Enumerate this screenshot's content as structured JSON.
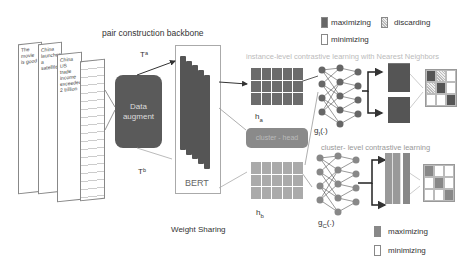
{
  "title": "pair construction backbone",
  "documents": [
    {
      "text": "The movie is good"
    },
    {
      "text": "China launches a satellite"
    },
    {
      "text": "China US trade income exceeded 2 trillion"
    },
    {
      "text": ""
    }
  ],
  "labels": {
    "ta": "Tᵃ",
    "tb": "Tᵇ",
    "data_augment": "Data augment",
    "bert": "BERT",
    "weight_sharing": "Weight Sharing",
    "ha": "h",
    "ha_sub": "a",
    "hb": "h",
    "hb_sub": "b",
    "cluster_head": "cluster - head",
    "gi": "g",
    "gi_sub": "I",
    "gi_suffix": "(.)",
    "gc": "g",
    "gc_sub": "C",
    "gc_suffix": "(.)",
    "instance_title": "instance-level contrastive learning with Nearest Neighbors",
    "cluster_title": "cluster- level contrastive learning"
  },
  "legend_top": [
    {
      "label": "maximizing",
      "style": "dark"
    },
    {
      "label": "discarding",
      "style": "hatch"
    },
    {
      "label": "minimizing",
      "style": "white"
    }
  ],
  "legend_bottom": [
    {
      "label": "maximizing",
      "style": "gray"
    },
    {
      "label": "minimizing",
      "style": "white"
    }
  ],
  "instance_matrix": [
    [
      "dark",
      "hatch",
      "white"
    ],
    [
      "hatch",
      "dark",
      "white"
    ],
    [
      "white",
      "white",
      "dark"
    ]
  ],
  "cluster_matrix": [
    [
      "gray",
      "white",
      "white"
    ],
    [
      "white",
      "gray",
      "white"
    ],
    [
      "white",
      "white",
      "gray"
    ]
  ],
  "colors": {
    "dark": "#555555",
    "gray": "#888888",
    "light": "#aaaaaa"
  }
}
